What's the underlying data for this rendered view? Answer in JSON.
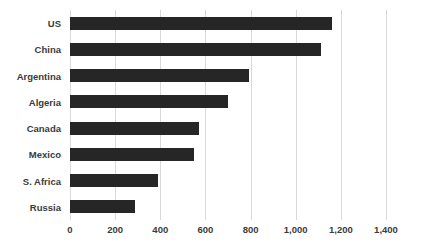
{
  "chart_data": {
    "type": "bar",
    "orientation": "horizontal",
    "title": "",
    "xlabel": "",
    "ylabel": "",
    "categories": [
      "US",
      "China",
      "Argentina",
      "Algeria",
      "Canada",
      "Mexico",
      "S. Africa",
      "Russia"
    ],
    "values": [
      1160,
      1110,
      795,
      700,
      570,
      550,
      390,
      290
    ],
    "xlim": [
      0,
      1400
    ],
    "xticks": [
      0,
      200,
      400,
      600,
      800,
      1000,
      1200,
      1400
    ],
    "xtick_labels": [
      "0",
      "200",
      "400",
      "600",
      "800",
      "1,000",
      "1,200",
      "1,400"
    ],
    "grid": "vertical",
    "legend": "none",
    "bar_color": "#262626",
    "gridline_color": "#d9d9d9",
    "background_color": "#ffffff",
    "text_color": "#3b3b3b"
  }
}
